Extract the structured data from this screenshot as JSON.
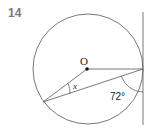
{
  "question": {
    "number": "14"
  },
  "diagram": {
    "center_label": "O",
    "angle_unknown_label": "x",
    "angle_known_label": "72°",
    "colors": {
      "stroke": "#555555",
      "text": "#222222"
    }
  }
}
